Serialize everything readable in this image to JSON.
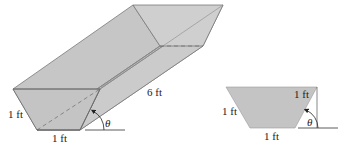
{
  "figure_left": {
    "title": "trough",
    "labels": {
      "side": "1 ft",
      "bottom": "1 ft",
      "length": "6 ft",
      "angle": "θ"
    }
  },
  "figure_right": {
    "title": "cross-section",
    "labels": {
      "right_side": "1 ft",
      "left_side": "1 ft",
      "bottom": "1 ft",
      "angle": "θ"
    }
  },
  "colors": {
    "fill": "#c4c4c4",
    "fill_light": "#cecece",
    "stroke": "#6a6a6a"
  }
}
